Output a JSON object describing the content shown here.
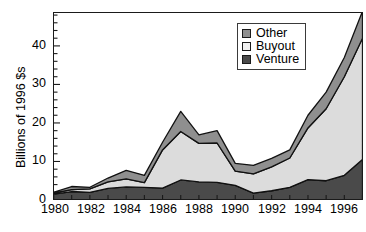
{
  "chart_data": {
    "type": "area",
    "title": "",
    "subtitle": "",
    "xlabel": "",
    "ylabel": "Billions of 1996 $s",
    "stacked": true,
    "grid": false,
    "legend_position": "top-right",
    "xlim": [
      1980,
      1997
    ],
    "ylim": [
      0,
      49
    ],
    "x": [
      1980,
      1981,
      1982,
      1983,
      1984,
      1985,
      1986,
      1987,
      1988,
      1989,
      1990,
      1991,
      1992,
      1993,
      1994,
      1995,
      1996,
      1997
    ],
    "xticks": [
      1980,
      1982,
      1984,
      1986,
      1988,
      1990,
      1992,
      1994,
      1996
    ],
    "xtick_labels": [
      "1980",
      "1982",
      "1984",
      "1986",
      "1988",
      "1990",
      "1992",
      "1994",
      "1996"
    ],
    "yticks": [
      0,
      10,
      20,
      30,
      40
    ],
    "ytick_labels": [
      "0",
      "10",
      "20",
      "30",
      "40"
    ],
    "series": [
      {
        "name": "Venture",
        "color": "#4a4a4a",
        "values": [
          1.5,
          2.2,
          2.0,
          3.0,
          3.4,
          3.3,
          3.1,
          5.2,
          4.7,
          4.6,
          3.8,
          1.8,
          2.4,
          3.3,
          5.3,
          5.0,
          6.4,
          10.5
        ]
      },
      {
        "name": "Buyout",
        "color": "#dcdcdc",
        "values": [
          0.3,
          0.5,
          0.9,
          1.7,
          2.1,
          1.2,
          9.9,
          12.6,
          10.0,
          10.2,
          3.7,
          5.0,
          6.2,
          7.6,
          13.4,
          18.7,
          25.6,
          31.5
        ]
      },
      {
        "name": "Other",
        "color": "#8f8f8f",
        "values": [
          0.2,
          0.8,
          0.4,
          1.0,
          2.2,
          1.9,
          2.0,
          5.2,
          2.2,
          3.2,
          2.0,
          2.2,
          2.2,
          2.1,
          3.3,
          4.3,
          5.0,
          7.0
        ]
      }
    ],
    "totals": [
      2.0,
      3.5,
      3.3,
      5.7,
      7.7,
      6.4,
      15.0,
      23.0,
      16.9,
      18.0,
      9.5,
      9.0,
      10.8,
      13.0,
      22.0,
      28.0,
      37.0,
      49.0
    ]
  },
  "legend": {
    "items": [
      {
        "label": "Other",
        "swatch_color": "#8f8f8f"
      },
      {
        "label": "Buyout",
        "swatch_color": "#efefef"
      },
      {
        "label": "Venture",
        "swatch_color": "#4a4a4a"
      }
    ]
  },
  "axis": {
    "y_title": "Billions of 1996 $s",
    "y_labels": [
      "40",
      "30",
      "20",
      "10",
      "0"
    ],
    "x_labels": [
      "1980",
      "1982",
      "1984",
      "1986",
      "1988",
      "1990",
      "1992",
      "1994",
      "1996"
    ]
  },
  "colors": {
    "other": "#8f8f8f",
    "buyout": "#dcdcdc",
    "venture": "#4a4a4a",
    "axis": "#1a1a1a",
    "background": "#ffffff"
  }
}
